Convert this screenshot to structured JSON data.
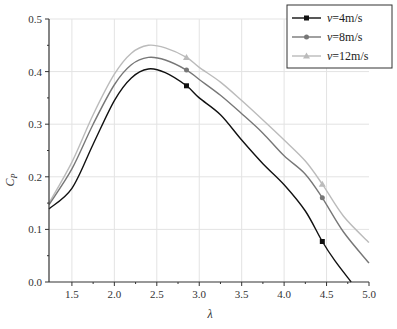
{
  "chart_data": {
    "type": "line",
    "title": "",
    "xlabel": "λ",
    "ylabel": "C_P",
    "xlim": [
      1.23,
      5.0
    ],
    "ylim": [
      0.0,
      0.5
    ],
    "xticks": [
      1.5,
      2.0,
      2.5,
      3.0,
      3.5,
      4.0,
      4.5,
      5.0
    ],
    "xtick_labels": [
      "1.5",
      "2.0",
      "2.5",
      "3.0",
      "3.5",
      "4.0",
      "4.5",
      "5.0"
    ],
    "yticks": [
      0.0,
      0.1,
      0.2,
      0.3,
      0.4,
      0.5
    ],
    "ytick_labels": [
      "0.0",
      "0.1",
      "0.2",
      "0.3",
      "0.4",
      "0.5"
    ],
    "grid": true,
    "legend_position": "upper right",
    "series": [
      {
        "name": "v=4m/s",
        "color": "#111111",
        "marker": "square",
        "x": [
          1.23,
          1.5,
          1.75,
          2.0,
          2.2,
          2.4,
          2.6,
          2.85,
          3.0,
          3.25,
          3.5,
          3.75,
          4.0,
          4.25,
          4.45,
          4.6,
          4.79
        ],
        "y": [
          0.139,
          0.178,
          0.262,
          0.345,
          0.388,
          0.405,
          0.398,
          0.373,
          0.35,
          0.318,
          0.27,
          0.225,
          0.185,
          0.135,
          0.077,
          0.04,
          0.0
        ],
        "marker_x": [
          2.85,
          4.45
        ],
        "marker_y": [
          0.373,
          0.077
        ]
      },
      {
        "name": "v=8m/s",
        "color": "#777777",
        "marker": "circle",
        "x": [
          1.23,
          1.5,
          1.75,
          2.0,
          2.2,
          2.4,
          2.6,
          2.85,
          3.0,
          3.25,
          3.5,
          3.75,
          4.0,
          4.25,
          4.45,
          4.7,
          5.0
        ],
        "y": [
          0.147,
          0.215,
          0.3,
          0.375,
          0.413,
          0.427,
          0.422,
          0.403,
          0.385,
          0.355,
          0.32,
          0.283,
          0.24,
          0.205,
          0.16,
          0.095,
          0.036
        ],
        "marker_x": [
          2.85,
          4.45
        ],
        "marker_y": [
          0.403,
          0.16
        ]
      },
      {
        "name": "v=12m/s",
        "color": "#bbbbbb",
        "marker": "triangle",
        "x": [
          1.23,
          1.5,
          1.75,
          2.0,
          2.2,
          2.4,
          2.6,
          2.85,
          3.0,
          3.25,
          3.5,
          3.75,
          4.0,
          4.25,
          4.45,
          4.7,
          5.0
        ],
        "y": [
          0.15,
          0.228,
          0.318,
          0.395,
          0.435,
          0.45,
          0.445,
          0.427,
          0.408,
          0.38,
          0.345,
          0.308,
          0.27,
          0.23,
          0.186,
          0.125,
          0.075
        ],
        "marker_x": [
          2.85,
          4.45
        ],
        "marker_y": [
          0.427,
          0.186
        ]
      }
    ]
  },
  "legend": {
    "items": [
      "v=4m/s",
      "v=8m/s",
      "v=12m/s"
    ]
  }
}
